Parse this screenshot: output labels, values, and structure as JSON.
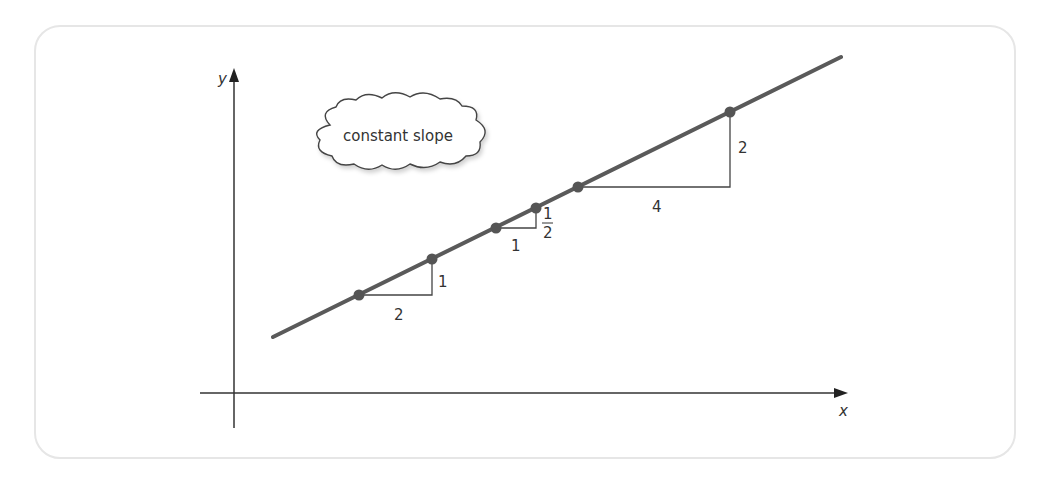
{
  "diagram": {
    "title_bubble": "constant slope",
    "axes": {
      "x_label": "x",
      "y_label": "y"
    },
    "line_color": "#5a5a5a",
    "point_color": "#555555",
    "triangles": [
      {
        "run": "2",
        "rise": "1"
      },
      {
        "run": "1",
        "rise_num": "1",
        "rise_den": "2"
      },
      {
        "run": "4",
        "rise": "2"
      }
    ]
  }
}
